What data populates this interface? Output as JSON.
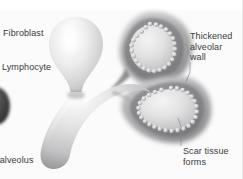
{
  "figure": {
    "type": "medical-illustration",
    "background_color": "#fbfbfb",
    "top_band_color": "#ffffff",
    "label_color": "#3a3a3a"
  },
  "labels": [
    {
      "id": "fibroblast",
      "text": "Fibroblast",
      "position": "top-left",
      "has_leader_line": false
    },
    {
      "id": "lymphocyte",
      "text": "Lymphocyte",
      "position": "mid-left",
      "has_leader_line": false
    },
    {
      "id": "thickened_alveolar_wall",
      "text": "Thickened\nalveolar\nwall",
      "position": "top-right",
      "has_leader_line": true
    },
    {
      "id": "scar_tissue_forms",
      "text": "Scar tissue\nforms",
      "position": "bottom-right",
      "has_leader_line": true
    },
    {
      "id": "normal_alveolus",
      "text": "d alveolus",
      "position": "bottom-left",
      "has_leader_line": false,
      "note": "text clipped at left image edge"
    }
  ],
  "structures": [
    {
      "id": "alveolus-normal-left",
      "name": "normal alveolus",
      "fill": "#e9e9ea",
      "wall": "thin",
      "lining_cells": false
    },
    {
      "id": "alveolus-fibrotic-upper-right",
      "name": "fibrotic alveolus upper right",
      "fill": "#b9b9bb",
      "wall": "thickened",
      "lining_cells": true,
      "cell_count": 22
    },
    {
      "id": "alveolus-fibrotic-lower-right",
      "name": "fibrotic alveolus lower right",
      "fill": "#b9b9bb",
      "wall": "thickened",
      "lining_cells": true,
      "cell_count": 24
    },
    {
      "id": "alveolar-duct",
      "name": "alveolar duct stem",
      "fill": "#d7d7d9",
      "wall": "thin",
      "lining_cells": false
    },
    {
      "id": "cell-edge-left",
      "name": "partial cell at left edge",
      "fill": "#4a4a4c",
      "clipped": true
    }
  ]
}
